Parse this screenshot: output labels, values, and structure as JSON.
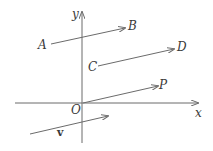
{
  "diagram": {
    "type": "vector-diagram",
    "stroke_color": "#6b6b6b",
    "label_color": "#3a3a3a",
    "axes": {
      "x_label": "x",
      "y_label": "y",
      "origin_label": "O"
    },
    "points": {
      "A": "A",
      "B": "B",
      "C": "C",
      "D": "D",
      "P": "P"
    },
    "vector_label": "v",
    "vectors": [
      {
        "name": "AB",
        "from": "A",
        "to": "B"
      },
      {
        "name": "CD",
        "from": "C",
        "to": "D"
      },
      {
        "name": "OP",
        "from": "O",
        "to": "P"
      },
      {
        "name": "v",
        "from": "",
        "to": ""
      }
    ]
  }
}
